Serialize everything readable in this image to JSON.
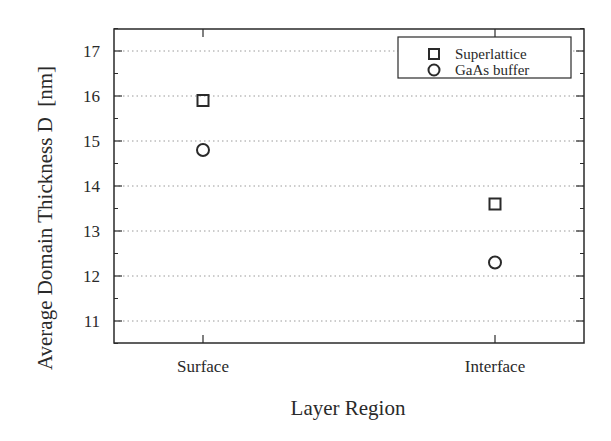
{
  "chart_data": {
    "type": "scatter",
    "title": "",
    "xlabel": "Layer Region",
    "ylabel": "Average Domain Thickness D  [nm]",
    "categories": [
      "Surface",
      "Interface"
    ],
    "ylim": [
      10.5,
      17.5
    ],
    "yticks": [
      11,
      12,
      13,
      14,
      15,
      16,
      17
    ],
    "grid": "horizontal dotted",
    "legend_position": "top-right",
    "series": [
      {
        "name": "Superlattice",
        "marker": "square",
        "values": [
          15.9,
          13.6
        ]
      },
      {
        "name": "GaAs buffer",
        "marker": "circle",
        "values": [
          14.8,
          12.3
        ]
      }
    ],
    "colors": {
      "ink": "#2a2a2a",
      "grid": "#9a9a9a"
    }
  }
}
